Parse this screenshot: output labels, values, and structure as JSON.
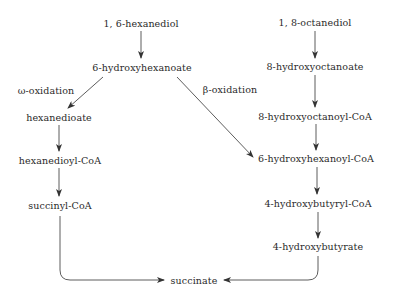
{
  "diagram": {
    "type": "metabolic-pathway",
    "colors": {
      "text": "#2a2a2a",
      "line": "#333333",
      "background": "#ffffff"
    },
    "nodes": {
      "hexanediol": "1, 6-hexanediol",
      "hydroxyhexanoate": "6-hydroxyhexanoate",
      "hexanedioate": "hexanedioate",
      "hexanedioyl_coa": "hexanedioyl-CoA",
      "succinyl_coa": "succinyl-CoA",
      "succinate": "succinate",
      "octanediol": "1, 8-octanediol",
      "hydroxyoctanoate": "8-hydroxyoctanoate",
      "hydroxyoctanoyl_coa": "8-hydroxyoctanoyl-CoA",
      "hydroxyhexanoyl_coa": "6-hydroxyhexanoyl-CoA",
      "hydroxybutyryl_coa": "4-hydroxybutyryl-CoA",
      "hydroxybutyrate": "4-hydroxybutyrate"
    },
    "edge_labels": {
      "omega_oxidation": "ω-oxidation",
      "beta_oxidation": "β-oxidation"
    },
    "edges": [
      {
        "from": "1, 6-hexanediol",
        "to": "6-hydroxyhexanoate"
      },
      {
        "from": "6-hydroxyhexanoate",
        "to": "hexanedioate",
        "label": "ω-oxidation"
      },
      {
        "from": "6-hydroxyhexanoate",
        "to": "6-hydroxyhexanoyl-CoA",
        "label": "β-oxidation"
      },
      {
        "from": "hexanedioate",
        "to": "hexanedioyl-CoA"
      },
      {
        "from": "hexanedioyl-CoA",
        "to": "succinyl-CoA"
      },
      {
        "from": "succinyl-CoA",
        "to": "succinate"
      },
      {
        "from": "1, 8-octanediol",
        "to": "8-hydroxyoctanoate"
      },
      {
        "from": "8-hydroxyoctanoate",
        "to": "8-hydroxyoctanoyl-CoA"
      },
      {
        "from": "8-hydroxyoctanoyl-CoA",
        "to": "6-hydroxyhexanoyl-CoA"
      },
      {
        "from": "6-hydroxyhexanoyl-CoA",
        "to": "4-hydroxybutyryl-CoA"
      },
      {
        "from": "4-hydroxybutyryl-CoA",
        "to": "4-hydroxybutyrate"
      },
      {
        "from": "4-hydroxybutyrate",
        "to": "succinate"
      }
    ]
  }
}
